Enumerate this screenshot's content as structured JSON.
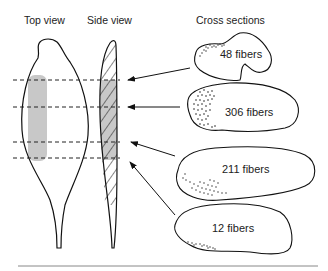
{
  "headings": {
    "top_view": "Top view",
    "side_view": "Side view",
    "cross_sections": "Cross sections"
  },
  "cross_sections": [
    {
      "label": "48 fibers",
      "fibers": 48
    },
    {
      "label": "306 fibers",
      "fibers": 306
    },
    {
      "label": "211 fibers",
      "fibers": 211
    },
    {
      "label": "12 fibers",
      "fibers": 12
    }
  ],
  "colors": {
    "stroke": "#111111",
    "shading": "#c8c8c8",
    "rule": "#888888"
  }
}
